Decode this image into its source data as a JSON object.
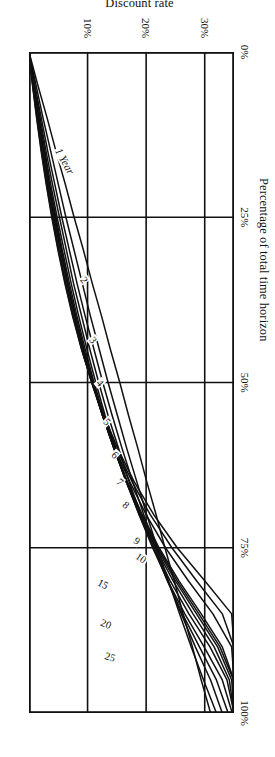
{
  "chart_data": {
    "type": "line",
    "title": "",
    "xlabel": "Percentage of total time horizon",
    "ylabel": "Discount rate",
    "xlim": [
      0,
      100
    ],
    "ylim": [
      0,
      35
    ],
    "grid": true,
    "legend_position": "inline-curve-labels",
    "x_ticks": [
      {
        "value": 0,
        "label": "0%"
      },
      {
        "value": 25,
        "label": "25%"
      },
      {
        "value": 50,
        "label": "50%"
      },
      {
        "value": 75,
        "label": "75%"
      },
      {
        "value": 100,
        "label": "100%"
      }
    ],
    "y_ticks": [
      {
        "value": 10,
        "label": "10%"
      },
      {
        "value": 20,
        "label": "20%"
      },
      {
        "value": 30,
        "label": "30%"
      }
    ],
    "series": [
      {
        "name": "1 Year",
        "label": "1 Year",
        "horizon_years": 1,
        "x": [
          0,
          5,
          10,
          15,
          20,
          25,
          30,
          35,
          40,
          45,
          50,
          55,
          60,
          65,
          70,
          75,
          80,
          85,
          90,
          95,
          100
        ],
        "y": [
          0,
          1.5,
          3.1,
          4.6,
          6.2,
          7.7,
          9.3,
          10.8,
          12.4,
          13.9,
          15.5,
          17.0,
          18.6,
          20.1,
          21.7,
          23.2,
          24.8,
          26.3,
          27.9,
          29.4,
          31.0
        ]
      },
      {
        "name": "2",
        "label": "2",
        "horizon_years": 2,
        "x": [
          0,
          5,
          10,
          15,
          20,
          25,
          30,
          35,
          40,
          45,
          50,
          55,
          60,
          65,
          70,
          75,
          80,
          85,
          90,
          95,
          100
        ],
        "y": [
          0,
          1.2,
          2.4,
          3.7,
          5.0,
          6.3,
          7.7,
          9.1,
          10.5,
          12.0,
          13.5,
          15.1,
          16.7,
          18.4,
          20.1,
          21.9,
          23.8,
          25.7,
          27.7,
          29.8,
          32.0
        ]
      },
      {
        "name": "3",
        "label": "3",
        "horizon_years": 3,
        "x": [
          0,
          5,
          10,
          15,
          20,
          25,
          30,
          35,
          40,
          45,
          50,
          55,
          60,
          65,
          70,
          75,
          80,
          85,
          90,
          95,
          100
        ],
        "y": [
          0,
          1.0,
          2.1,
          3.2,
          4.4,
          5.6,
          6.9,
          8.2,
          9.6,
          11.1,
          12.6,
          14.2,
          15.9,
          17.7,
          19.6,
          21.6,
          23.7,
          26.0,
          28.4,
          31.0,
          33.0
        ]
      },
      {
        "name": "4",
        "label": "4",
        "horizon_years": 4,
        "x": [
          0,
          5,
          10,
          15,
          20,
          25,
          30,
          35,
          40,
          45,
          50,
          55,
          60,
          65,
          70,
          75,
          80,
          85,
          90,
          95,
          100
        ],
        "y": [
          0,
          0.9,
          1.9,
          2.9,
          4.0,
          5.2,
          6.4,
          7.6,
          9.0,
          10.4,
          11.9,
          13.5,
          15.3,
          17.1,
          19.1,
          21.3,
          23.6,
          26.2,
          29.1,
          32.0,
          34.0
        ]
      },
      {
        "name": "5",
        "label": "5",
        "horizon_years": 5,
        "x": [
          0,
          5,
          10,
          15,
          20,
          25,
          30,
          35,
          40,
          45,
          50,
          55,
          60,
          65,
          70,
          75,
          80,
          85,
          90,
          95,
          100
        ],
        "y": [
          0,
          0.85,
          1.8,
          2.7,
          3.7,
          4.8,
          6.0,
          7.2,
          8.5,
          9.9,
          11.4,
          13.0,
          14.8,
          16.7,
          18.8,
          21.1,
          23.7,
          26.6,
          29.9,
          33.0,
          34.7
        ]
      },
      {
        "name": "6",
        "label": "6",
        "horizon_years": 6,
        "x": [
          0,
          5,
          10,
          15,
          20,
          25,
          30,
          35,
          40,
          45,
          50,
          55,
          60,
          65,
          70,
          75,
          80,
          85,
          90,
          95,
          100
        ],
        "y": [
          0,
          0.8,
          1.7,
          2.6,
          3.5,
          4.6,
          5.7,
          6.9,
          8.2,
          9.6,
          11.1,
          12.8,
          14.6,
          16.6,
          18.8,
          21.3,
          24.1,
          27.3,
          30.9,
          33.8,
          35.0
        ]
      },
      {
        "name": "7",
        "label": "7",
        "horizon_years": 7,
        "x": [
          0,
          5,
          10,
          15,
          20,
          25,
          30,
          35,
          40,
          45,
          50,
          55,
          60,
          65,
          70,
          75,
          80,
          85,
          90,
          95,
          100
        ],
        "y": [
          0,
          0.78,
          1.63,
          2.5,
          3.4,
          4.45,
          5.55,
          6.7,
          8.0,
          9.4,
          10.9,
          12.6,
          14.5,
          16.6,
          18.9,
          21.6,
          24.6,
          28.0,
          31.6,
          34.2,
          35.0
        ]
      },
      {
        "name": "8",
        "label": "8",
        "horizon_years": 8,
        "x": [
          0,
          5,
          10,
          15,
          20,
          25,
          30,
          35,
          40,
          45,
          50,
          55,
          60,
          65,
          70,
          75,
          80,
          85,
          90,
          95,
          100
        ],
        "y": [
          0,
          0.76,
          1.58,
          2.45,
          3.35,
          4.35,
          5.45,
          6.6,
          7.9,
          9.3,
          10.85,
          12.55,
          14.5,
          16.6,
          19.0,
          21.8,
          25.0,
          28.6,
          32.2,
          34.6,
          35.0
        ]
      },
      {
        "name": "9",
        "label": "9",
        "horizon_years": 9,
        "x": [
          0,
          5,
          10,
          15,
          20,
          25,
          30,
          35,
          40,
          45,
          50,
          55,
          60,
          65,
          70,
          75,
          80,
          85,
          90,
          95,
          100
        ],
        "y": [
          0,
          0.74,
          1.55,
          2.4,
          3.3,
          4.3,
          5.4,
          6.55,
          7.85,
          9.25,
          10.8,
          12.55,
          14.5,
          16.7,
          19.2,
          22.0,
          25.3,
          29.0,
          32.6,
          34.9,
          35.0
        ]
      },
      {
        "name": "10",
        "label": "10",
        "horizon_years": 10,
        "x": [
          0,
          5,
          10,
          15,
          20,
          25,
          30,
          35,
          40,
          45,
          50,
          55,
          60,
          65,
          70,
          75,
          80,
          85,
          90,
          95,
          100
        ],
        "y": [
          0,
          0.72,
          1.52,
          2.36,
          3.26,
          4.26,
          5.36,
          6.5,
          7.8,
          9.2,
          10.8,
          12.55,
          14.55,
          16.8,
          19.35,
          22.2,
          25.6,
          29.4,
          33.0,
          35.0,
          35.0
        ]
      },
      {
        "name": "15",
        "label": "15",
        "horizon_years": 15,
        "x": [
          0,
          5,
          10,
          15,
          20,
          25,
          30,
          35,
          40,
          45,
          50,
          55,
          60,
          65,
          70,
          75,
          80,
          85,
          90,
          95,
          100
        ],
        "y": [
          0,
          0.66,
          1.42,
          2.22,
          3.1,
          4.08,
          5.15,
          6.3,
          7.6,
          9.05,
          10.7,
          12.55,
          14.7,
          17.2,
          20.0,
          23.3,
          27.2,
          31.4,
          34.6,
          35.0,
          35.0
        ]
      },
      {
        "name": "20",
        "label": "20",
        "horizon_years": 20,
        "x": [
          0,
          5,
          10,
          15,
          20,
          25,
          30,
          35,
          40,
          45,
          50,
          55,
          60,
          65,
          70,
          75,
          80,
          85,
          90,
          95,
          100
        ],
        "y": [
          0,
          0.62,
          1.35,
          2.13,
          3.0,
          3.96,
          5.02,
          6.2,
          7.5,
          9.0,
          10.7,
          12.65,
          14.9,
          17.6,
          20.7,
          24.4,
          28.6,
          33.0,
          35.0,
          35.0,
          35.0
        ]
      },
      {
        "name": "25",
        "label": "25",
        "horizon_years": 25,
        "x": [
          0,
          5,
          10,
          15,
          20,
          25,
          30,
          35,
          40,
          45,
          50,
          55,
          60,
          65,
          70,
          75,
          80,
          85,
          90,
          95,
          100
        ],
        "y": [
          0,
          0.6,
          1.3,
          2.07,
          2.93,
          3.88,
          4.95,
          6.12,
          7.45,
          8.98,
          10.75,
          12.8,
          15.15,
          17.95,
          21.3,
          25.3,
          30.0,
          34.6,
          35.0,
          35.0,
          35.0
        ]
      }
    ],
    "curve_labels": [
      {
        "text": "1 Year",
        "x": 16.5,
        "y": 6.2,
        "rotation": -29
      },
      {
        "text": "2",
        "x": 34.5,
        "y": 9.4,
        "rotation": -36
      },
      {
        "text": "3",
        "x": 43.5,
        "y": 11.0,
        "rotation": -39
      },
      {
        "text": "4",
        "x": 50.0,
        "y": 12.1,
        "rotation": -41
      },
      {
        "text": "5",
        "x": 56.0,
        "y": 13.4,
        "rotation": -44
      },
      {
        "text": "6",
        "x": 61.0,
        "y": 14.6,
        "rotation": -47
      },
      {
        "text": "7",
        "x": 65.0,
        "y": 15.6,
        "rotation": -49
      },
      {
        "text": "8",
        "x": 68.5,
        "y": 16.6,
        "rotation": -51
      },
      {
        "text": "9",
        "x": 74.0,
        "y": 18.4,
        "rotation": -54
      },
      {
        "text": "10",
        "x": 76.5,
        "y": 19.2,
        "rotation": -56
      },
      {
        "text": "15",
        "x": 80.5,
        "y": 12.6,
        "rotation": -62
      },
      {
        "text": "20",
        "x": 86.5,
        "y": 13.2,
        "rotation": -68
      },
      {
        "text": "25",
        "x": 91.5,
        "y": 13.9,
        "rotation": -72
      }
    ]
  },
  "figure": {
    "x_axis_title": "Percentage of total time horizon",
    "y_axis_title": "Discount rate"
  }
}
